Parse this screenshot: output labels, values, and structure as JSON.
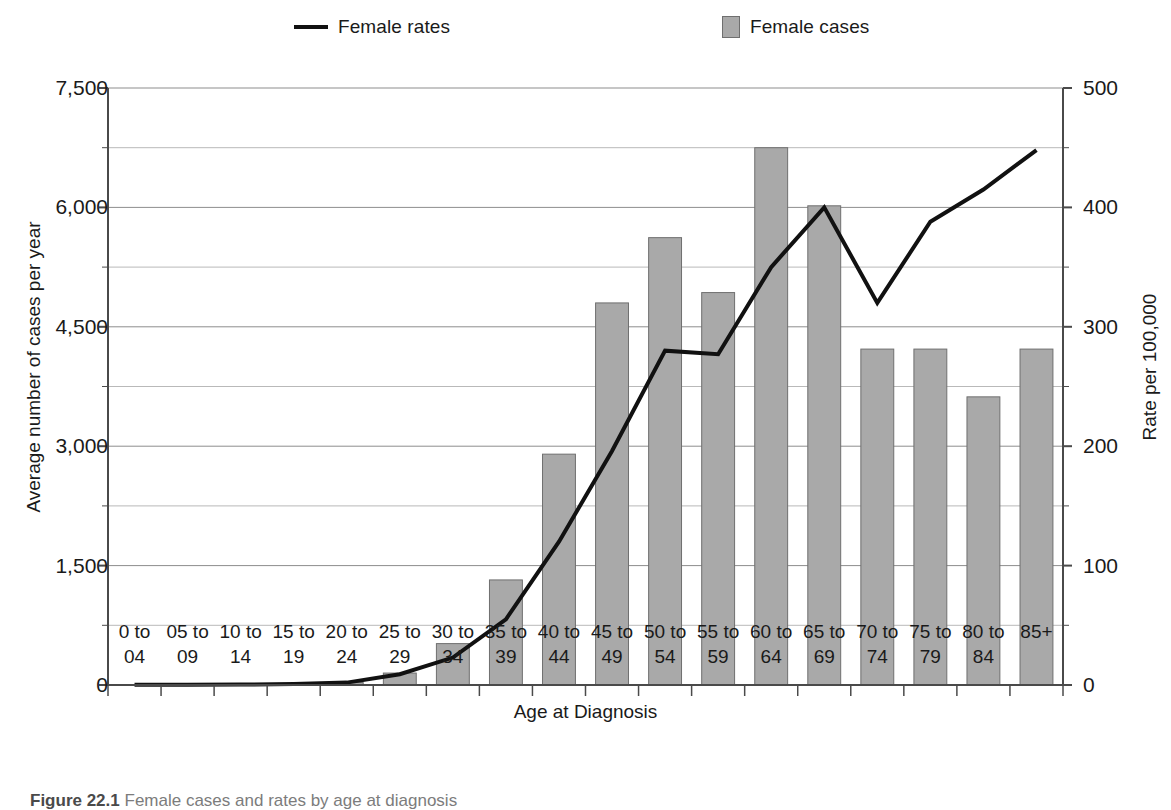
{
  "legend": {
    "rates": {
      "label": "Female rates",
      "marker": "line-marker",
      "color": "#111111"
    },
    "cases": {
      "label": "Female cases",
      "marker": "square-swatch",
      "color": "#a9a9a9",
      "border": "#6f6f6f"
    }
  },
  "axes": {
    "y_left_title": "Average number of cases per year",
    "y_right_title": "Rate per 100,000",
    "x_title": "Age at Diagnosis",
    "y_left_ticks": [
      "0",
      "1,500",
      "3,000",
      "4,500",
      "6,000",
      "7,500"
    ],
    "y_right_ticks": [
      "0",
      "100",
      "200",
      "300",
      "400",
      "500"
    ]
  },
  "caption": {
    "label": "Figure 22.1",
    "text": "Female cases and rates by age at diagnosis"
  },
  "chart_data": {
    "type": "bar",
    "title": "",
    "xlabel": "Age at Diagnosis",
    "ylabel": "Average number of cases per year",
    "y2label": "Rate per 100,000",
    "ylim": [
      0,
      7500
    ],
    "y2lim": [
      0,
      500
    ],
    "ytick_step": 1500,
    "y_minor_step": 750,
    "y2tick_step": 100,
    "grid": true,
    "legend_position": "top",
    "categories": [
      "0 to 04",
      "05 to 09",
      "10 to 14",
      "15 to 19",
      "20 to 24",
      "25 to 29",
      "30 to 34",
      "35 to 39",
      "40 to 44",
      "45 to 49",
      "50 to 54",
      "55 to 59",
      "60 to 64",
      "65 to 69",
      "70 to 74",
      "75 to 79",
      "80 to 84",
      "85+"
    ],
    "category_lines": [
      [
        "0 to",
        "04"
      ],
      [
        "05 to",
        "09"
      ],
      [
        "10 to",
        "14"
      ],
      [
        "15 to",
        "19"
      ],
      [
        "20 to",
        "24"
      ],
      [
        "25 to",
        "29"
      ],
      [
        "30 to",
        "34"
      ],
      [
        "35 to",
        "39"
      ],
      [
        "40 to",
        "44"
      ],
      [
        "45 to",
        "49"
      ],
      [
        "50 to",
        "54"
      ],
      [
        "55 to",
        "59"
      ],
      [
        "60 to",
        "64"
      ],
      [
        "65 to",
        "69"
      ],
      [
        "70 to",
        "74"
      ],
      [
        "75 to",
        "79"
      ],
      [
        "80 to",
        "84"
      ],
      [
        "85+",
        ""
      ]
    ],
    "series": [
      {
        "name": "Female cases",
        "kind": "bar",
        "axis": "left",
        "unit": "average cases per year",
        "values": [
          5,
          5,
          5,
          10,
          30,
          150,
          520,
          1320,
          2900,
          4800,
          5620,
          4930,
          6750,
          6020,
          4220,
          4220,
          3620,
          4220
        ]
      },
      {
        "name": "Female rates",
        "kind": "line",
        "axis": "right",
        "unit": "rate per 100,000",
        "values": [
          0.3,
          0.3,
          0.4,
          0.8,
          2,
          9,
          23,
          55,
          120,
          196,
          280,
          277,
          350,
          400,
          320,
          388,
          415,
          448
        ]
      }
    ]
  }
}
